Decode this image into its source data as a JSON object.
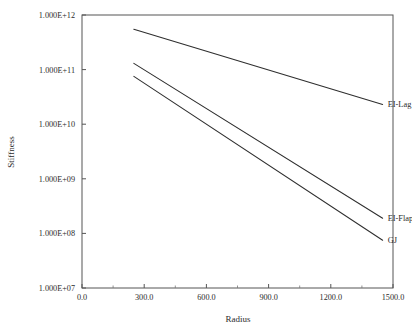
{
  "chart_data": {
    "type": "line",
    "title": "",
    "xlabel": "Radius",
    "ylabel": "Stiffness",
    "xlim": [
      0,
      1500
    ],
    "ylim": [
      10000000,
      1000000000000
    ],
    "yscale": "log",
    "xscale": "linear",
    "grid": false,
    "legend_position": "right-inline-labels",
    "x_ticks": [
      0,
      300,
      600,
      900,
      1200,
      1500
    ],
    "x_tick_labels": [
      "0.0",
      "300.0",
      "600.0",
      "900.0",
      "1200.0",
      "1500.0"
    ],
    "y_ticks": [
      10000000,
      100000000,
      1000000000,
      10000000000,
      100000000000,
      1000000000000
    ],
    "y_tick_labels": [
      "1.000E+07",
      "1.000E+08",
      "1.000E+09",
      "1.000E+10",
      "1.000E+11",
      "1.000E+12"
    ],
    "minor_x_ticks": [
      150,
      450,
      750,
      1050,
      1350
    ],
    "series": [
      {
        "name": "EI-Lag",
        "label": "EI-Lag",
        "color": "#2e2e2e",
        "x": [
          250,
          1450
        ],
        "values": [
          550000000000,
          23000000000
        ]
      },
      {
        "name": "EI-Flap",
        "label": "EI-Flap",
        "color": "#2e2e2e",
        "x": [
          250,
          1450
        ],
        "values": [
          130000000000,
          190000000
        ]
      },
      {
        "name": "GJ",
        "label": "GJ",
        "color": "#2e2e2e",
        "x": [
          250,
          1450
        ],
        "values": [
          75000000000,
          75000000
        ]
      }
    ]
  },
  "axes": {
    "x_title": "Radius",
    "y_title": "Stiffness"
  }
}
